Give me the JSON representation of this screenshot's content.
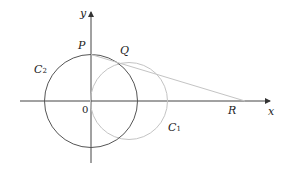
{
  "labels": {
    "y_axis": "y",
    "x_axis": "x",
    "P": "P",
    "Q": "Q",
    "R": "R",
    "origin": "0",
    "C2_main": "C",
    "C2_sub": "2",
    "C1_main": "C",
    "C1_sub": "1"
  },
  "colors": {
    "axes": "#333333",
    "circle_C2": "#555555",
    "circle_C1": "#bbbbbb",
    "line_QR": "#bbbbbb"
  }
}
